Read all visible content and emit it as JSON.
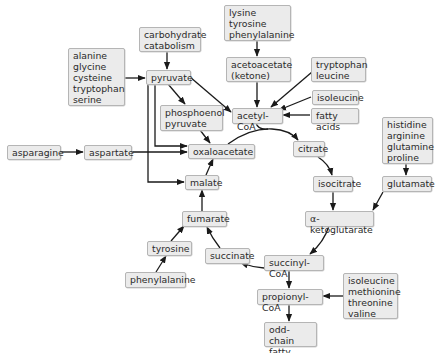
{
  "diagram": {
    "type": "metabolic-pathway",
    "colors": {
      "box_fill": "#ebebeb",
      "box_border": "#b5b5b5",
      "text": "#2a2a2a",
      "arrow": "#1a1a1a"
    },
    "nodes": {
      "carbohydrate_catabolism": "carbohydrate\ncatabolism",
      "amino_acids_pyruvate": "alanine\nglycine\ncysteine\ntryptophan\nserine",
      "pyruvate": "pyruvate",
      "amino_acids_ketogenic": "lysine\ntyrosine\nphenylalanine",
      "acetoacetate": "acetoacetate\n(ketone)",
      "tryptophan_leucine": "tryptophan\nleucine",
      "isoleucine_top": "isoleucine",
      "acetyl_coa": "acetyl-CoA",
      "fatty_acids": "fatty acids",
      "phosphoenolpyruvate": "phosphoenol\npyruvate",
      "asparagine": "asparagine",
      "aspartate": "aspartate",
      "oxaloacetate": "oxaloacetate",
      "citrate": "citrate",
      "amino_acids_glutamate": "histidine\narginine\nglutamine\nproline",
      "malate": "malate",
      "isocitrate": "isocitrate",
      "glutamate": "glutamate",
      "alpha_ketoglutarate": "α-ketoglutarate",
      "fumarate": "fumarate",
      "tyrosine": "tyrosine",
      "succinate": "succinate",
      "succinyl_coa": "succinyl-CoA",
      "phenylalanine": "phenylalanine",
      "amino_acids_propionyl": "isoleucine\nmethionine\nthreonine\nvaline",
      "propionyl_coa": "propionyl-CoA",
      "odd_chain_fatty_acids": "odd-chain\nfatty acids"
    },
    "edges": [
      [
        "carbohydrate_catabolism",
        "pyruvate"
      ],
      [
        "amino_acids_pyruvate",
        "pyruvate"
      ],
      [
        "pyruvate",
        "phosphoenolpyruvate"
      ],
      [
        "pyruvate",
        "acetyl_coa"
      ],
      [
        "pyruvate",
        "oxaloacetate"
      ],
      [
        "pyruvate",
        "malate"
      ],
      [
        "phosphoenolpyruvate",
        "oxaloacetate"
      ],
      [
        "amino_acids_ketogenic",
        "acetoacetate"
      ],
      [
        "acetoacetate",
        "acetyl_coa"
      ],
      [
        "tryptophan_leucine",
        "acetyl_coa"
      ],
      [
        "isoleucine_top",
        "acetyl_coa"
      ],
      [
        "fatty_acids",
        "acetyl_coa"
      ],
      [
        "acetyl_coa",
        "citrate"
      ],
      [
        "oxaloacetate",
        "citrate"
      ],
      [
        "asparagine",
        "aspartate"
      ],
      [
        "aspartate",
        "oxaloacetate"
      ],
      [
        "citrate",
        "isocitrate"
      ],
      [
        "isocitrate",
        "alpha_ketoglutarate"
      ],
      [
        "amino_acids_glutamate",
        "glutamate"
      ],
      [
        "glutamate",
        "alpha_ketoglutarate"
      ],
      [
        "alpha_ketoglutarate",
        "succinyl_coa"
      ],
      [
        "succinyl_coa",
        "succinate"
      ],
      [
        "succinate",
        "fumarate"
      ],
      [
        "fumarate",
        "malate"
      ],
      [
        "malate",
        "oxaloacetate"
      ],
      [
        "phenylalanine",
        "tyrosine"
      ],
      [
        "tyrosine",
        "fumarate"
      ],
      [
        "succinyl_coa",
        "propionyl_coa"
      ],
      [
        "amino_acids_propionyl",
        "propionyl_coa"
      ],
      [
        "propionyl_coa",
        "odd_chain_fatty_acids"
      ]
    ]
  }
}
